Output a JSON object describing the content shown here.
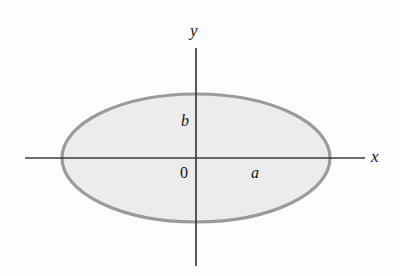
{
  "figure": {
    "name": "ellipse-with-axes-diagram",
    "background_color": "#fdfdfd",
    "labels": {
      "y_axis": "y",
      "x_axis": "x",
      "semi_minor": "b",
      "semi_major": "a",
      "origin": "0"
    }
  },
  "chart_data": {
    "type": "scatter",
    "title": "",
    "xlabel": "x",
    "ylabel": "y",
    "grid": false,
    "legend": null,
    "shape": "ellipse",
    "center": [
      0,
      0
    ],
    "semi_major_axis": {
      "symbol": "a",
      "direction": "horizontal",
      "pixel_length": 134
    },
    "semi_minor_axis": {
      "symbol": "b",
      "direction": "vertical",
      "pixel_length": 64
    },
    "annotations": [
      {
        "text": "y",
        "role": "axis-label",
        "x": 196,
        "y": 30
      },
      {
        "text": "x",
        "role": "axis-label",
        "x": 376,
        "y": 157
      },
      {
        "text": "b",
        "role": "dimension-label",
        "x": 186,
        "y": 121
      },
      {
        "text": "a",
        "role": "dimension-label",
        "x": 257,
        "y": 173
      },
      {
        "text": "0",
        "role": "origin-label",
        "x": 185,
        "y": 173
      }
    ],
    "axes": {
      "x_axis_pixels": {
        "x1": 25,
        "y1": 158,
        "x2": 365,
        "y2": 158
      },
      "y_axis_pixels": {
        "x1": 196,
        "y1": 48,
        "x2": 196,
        "y2": 266
      }
    },
    "colors": {
      "ellipse_fill": "#ececec",
      "ellipse_stroke": "#9a9a9a",
      "axis_stroke": "#3b3b3b",
      "text": "#151515"
    }
  }
}
